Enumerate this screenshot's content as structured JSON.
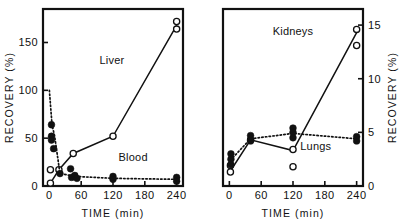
{
  "figure": {
    "name": "tissue-recovery-time-course",
    "panels": [
      "left",
      "right"
    ]
  },
  "chart_data": [
    {
      "type": "scatter",
      "panel": "left",
      "title": "",
      "xlabel": "TIME (min)",
      "ylabel": "RECOVERY (%)",
      "xlim": [
        -12,
        252
      ],
      "ylim": [
        0,
        185
      ],
      "xticks": [
        0,
        60,
        120,
        180,
        240
      ],
      "yticks": [
        0,
        50,
        100,
        150
      ],
      "xticklabels": [
        "0",
        "60",
        "120",
        "180",
        "240"
      ],
      "yticklabels": [
        "0",
        "50",
        "100",
        "150"
      ],
      "grid": false,
      "axis_side": "left",
      "legend": "inline-annotations",
      "series": [
        {
          "name": "Liver",
          "marker": "open-circle",
          "linestyle": "solid",
          "label_x": 118,
          "label_y": 128,
          "line_x": [
            2,
            18,
            45,
            120,
            240
          ],
          "line_y": [
            3,
            17,
            34,
            52,
            168
          ],
          "points": [
            {
              "x": 2,
              "y": 3
            },
            {
              "x": 2,
              "y": 17
            },
            {
              "x": 18,
              "y": 17
            },
            {
              "x": 45,
              "y": 34
            },
            {
              "x": 120,
              "y": 52
            },
            {
              "x": 240,
              "y": 172
            },
            {
              "x": 240,
              "y": 164
            }
          ]
        },
        {
          "name": "Blood",
          "marker": "filled-circle",
          "linestyle": "dotted",
          "label_x": 158,
          "label_y": 26,
          "line_x": [
            0,
            5,
            10,
            20,
            40,
            50,
            120,
            240
          ],
          "line_y": [
            100,
            64,
            52,
            13,
            11,
            10,
            8,
            7
          ],
          "points": [
            {
              "x": 4,
              "y": 64
            },
            {
              "x": 4,
              "y": 52
            },
            {
              "x": 4,
              "y": 48
            },
            {
              "x": 8,
              "y": 39
            },
            {
              "x": 20,
              "y": 13
            },
            {
              "x": 40,
              "y": 18
            },
            {
              "x": 42,
              "y": 9
            },
            {
              "x": 48,
              "y": 11
            },
            {
              "x": 52,
              "y": 8
            },
            {
              "x": 120,
              "y": 10
            },
            {
              "x": 120,
              "y": 7
            },
            {
              "x": 240,
              "y": 9
            },
            {
              "x": 240,
              "y": 5
            }
          ]
        }
      ]
    },
    {
      "type": "scatter",
      "panel": "right",
      "title": "",
      "xlabel": "TIME (min)",
      "ylabel": "RECOVERY (%)",
      "xlim": [
        -12,
        252
      ],
      "ylim": [
        0,
        16.5
      ],
      "xticks": [
        0,
        60,
        120,
        180,
        240
      ],
      "yticks": [
        0,
        5,
        10,
        15
      ],
      "xticklabels": [
        "0",
        "60",
        "120",
        "180",
        "240"
      ],
      "yticklabels": [
        "0",
        "5",
        "10",
        "15"
      ],
      "grid": false,
      "axis_side": "right",
      "legend": "inline-annotations",
      "series": [
        {
          "name": "Kidneys",
          "marker": "open-circle",
          "linestyle": "solid",
          "label_x": 120,
          "label_y": 14.1,
          "line_x": [
            2,
            40,
            120,
            240
          ],
          "line_y": [
            1.4,
            4.3,
            3.3,
            14.3
          ],
          "points": [
            {
              "x": 2,
              "y": 1.9
            },
            {
              "x": 2,
              "y": 1.3
            },
            {
              "x": 40,
              "y": 4.3
            },
            {
              "x": 120,
              "y": 3.4
            },
            {
              "x": 120,
              "y": 1.8
            },
            {
              "x": 240,
              "y": 14.6
            },
            {
              "x": 240,
              "y": 13.1
            }
          ]
        },
        {
          "name": "Lungs",
          "marker": "filled-circle",
          "linestyle": "dotted",
          "label_x": 163,
          "label_y": 3.4,
          "line_x": [
            2,
            40,
            120,
            240
          ],
          "line_y": [
            2.4,
            4.4,
            4.9,
            4.4
          ],
          "points": [
            {
              "x": 3,
              "y": 3.0
            },
            {
              "x": 3,
              "y": 2.5
            },
            {
              "x": 3,
              "y": 2.0
            },
            {
              "x": 40,
              "y": 4.7
            },
            {
              "x": 40,
              "y": 4.2
            },
            {
              "x": 120,
              "y": 5.4
            },
            {
              "x": 120,
              "y": 5.0
            },
            {
              "x": 120,
              "y": 4.5
            },
            {
              "x": 240,
              "y": 4.6
            },
            {
              "x": 240,
              "y": 4.2
            }
          ]
        }
      ]
    }
  ]
}
